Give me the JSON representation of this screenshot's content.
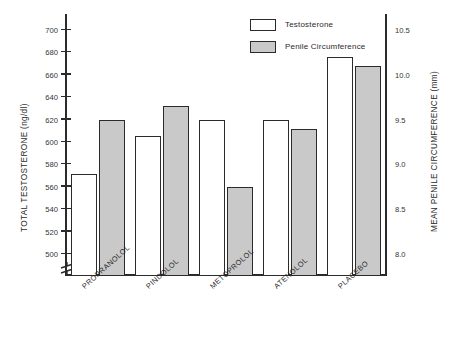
{
  "chart_data": {
    "type": "bar",
    "title": "",
    "categories": [
      "PROPRANOLOL",
      "PINDOLOL",
      "METOPROLOL",
      "ATENOLOL",
      "PLACEBO"
    ],
    "series": [
      {
        "name": "Testosterone",
        "axis": "left",
        "fill": "open",
        "units": "ng/dl",
        "values": [
          571,
          605,
          620,
          620,
          676
        ]
      },
      {
        "name": "Penile Circumference",
        "axis": "right",
        "fill": "filled",
        "units": "mm",
        "values": [
          9.5,
          9.65,
          8.75,
          9.4,
          10.1
        ]
      }
    ],
    "ylabel": "TOTAL TESTOSTERONE (ng/dl)",
    "ylabel_right": "MEAN PENILE CIRCUMFERENCE (mm)",
    "xlabel": "",
    "ylim": [
      500,
      700
    ],
    "ylim_right": [
      8.0,
      10.5
    ],
    "yticks": [
      500,
      520,
      540,
      560,
      580,
      600,
      620,
      640,
      660,
      680,
      700
    ],
    "yticks_right": [
      "8.0",
      "8.5",
      "9.0",
      "9.5",
      "10.0",
      "10.5"
    ],
    "axis_break": true,
    "grid": false,
    "legend_position": "top-center"
  },
  "legend": {
    "items": [
      {
        "label": "Testosterone",
        "swatch": "open"
      },
      {
        "label": "Penile Circumference",
        "swatch": "filled"
      }
    ]
  },
  "colors": {
    "bar_open": "#ffffff",
    "bar_filled": "#c9c9c9",
    "outline": "#2b2b2b",
    "background": "#ffffff",
    "text": "#2a2a2a"
  }
}
